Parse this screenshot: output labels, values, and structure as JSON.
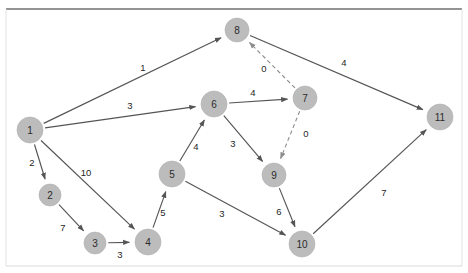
{
  "canvas": {
    "width": 468,
    "height": 273,
    "background": "#ffffff",
    "node_fill": "#bcbcbc",
    "node_text_color": "#2b2b2b",
    "edge_color": "#555555",
    "dashed_edge_color": "#8d8d8d",
    "top_rule_color": "#6f6f6f",
    "bottom_rule_color": "#d9d9d9"
  },
  "chart_data": {
    "type": "diagram",
    "title": "",
    "subtitle": "",
    "graph_kind": "directed-weighted-graph",
    "nodes": [
      {
        "id": "1",
        "label": "1",
        "x": 30,
        "y": 130,
        "r": 13
      },
      {
        "id": "2",
        "label": "2",
        "x": 50,
        "y": 195,
        "r": 11
      },
      {
        "id": "3",
        "label": "3",
        "x": 95,
        "y": 243,
        "r": 11
      },
      {
        "id": "4",
        "label": "4",
        "x": 148,
        "y": 242,
        "r": 13
      },
      {
        "id": "5",
        "label": "5",
        "x": 172,
        "y": 174,
        "r": 13
      },
      {
        "id": "6",
        "label": "6",
        "x": 214,
        "y": 104,
        "r": 13
      },
      {
        "id": "7",
        "label": "7",
        "x": 305,
        "y": 98,
        "r": 12
      },
      {
        "id": "8",
        "label": "8",
        "x": 237,
        "y": 30,
        "r": 12
      },
      {
        "id": "9",
        "label": "9",
        "x": 274,
        "y": 175,
        "r": 12
      },
      {
        "id": "10",
        "label": "10",
        "x": 302,
        "y": 244,
        "r": 13
      },
      {
        "id": "11",
        "label": "11",
        "x": 440,
        "y": 117,
        "r": 13
      }
    ],
    "edges": [
      {
        "from": "1",
        "to": "8",
        "weight": "1",
        "style": "solid",
        "label_x": 143,
        "label_y": 67
      },
      {
        "from": "1",
        "to": "6",
        "weight": "3",
        "style": "solid",
        "label_x": 130,
        "label_y": 105
      },
      {
        "from": "1",
        "to": "2",
        "weight": "2",
        "style": "solid",
        "label_x": 32,
        "label_y": 162
      },
      {
        "from": "1",
        "to": "4",
        "weight": "10",
        "style": "solid",
        "label_x": 86,
        "label_y": 172
      },
      {
        "from": "2",
        "to": "3",
        "weight": "7",
        "style": "solid",
        "label_x": 63,
        "label_y": 227
      },
      {
        "from": "3",
        "to": "4",
        "weight": "3",
        "style": "solid",
        "label_x": 120,
        "label_y": 254
      },
      {
        "from": "4",
        "to": "5",
        "weight": "5",
        "style": "solid",
        "label_x": 163,
        "label_y": 212
      },
      {
        "from": "5",
        "to": "6",
        "weight": "4",
        "style": "solid",
        "label_x": 196,
        "label_y": 146
      },
      {
        "from": "5",
        "to": "10",
        "weight": "3",
        "style": "solid",
        "label_x": 222,
        "label_y": 213
      },
      {
        "from": "6",
        "to": "7",
        "weight": "4",
        "style": "solid",
        "label_x": 253,
        "label_y": 92
      },
      {
        "from": "6",
        "to": "9",
        "weight": "3",
        "style": "solid",
        "label_x": 233,
        "label_y": 143
      },
      {
        "from": "7",
        "to": "8",
        "weight": "0",
        "style": "dashed",
        "label_x": 264,
        "label_y": 68
      },
      {
        "from": "7",
        "to": "9",
        "weight": "0",
        "style": "dashed",
        "label_x": 306,
        "label_y": 133
      },
      {
        "from": "8",
        "to": "11",
        "weight": "4",
        "style": "solid",
        "label_x": 344,
        "label_y": 62
      },
      {
        "from": "9",
        "to": "10",
        "weight": "6",
        "style": "solid",
        "label_x": 279,
        "label_y": 211
      },
      {
        "from": "10",
        "to": "11",
        "weight": "7",
        "style": "solid",
        "label_x": 384,
        "label_y": 192
      }
    ]
  }
}
